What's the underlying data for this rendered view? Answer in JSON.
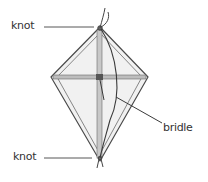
{
  "diagram": {
    "title": "",
    "colors": {
      "stroke": "#4a4a4a",
      "spar": "#8a8a8a",
      "sail_fill": "#f1f1f1",
      "text": "#333333"
    },
    "labels": {
      "top_knot": "knot",
      "bottom_knot": "knot",
      "bridle": "bridle"
    }
  }
}
